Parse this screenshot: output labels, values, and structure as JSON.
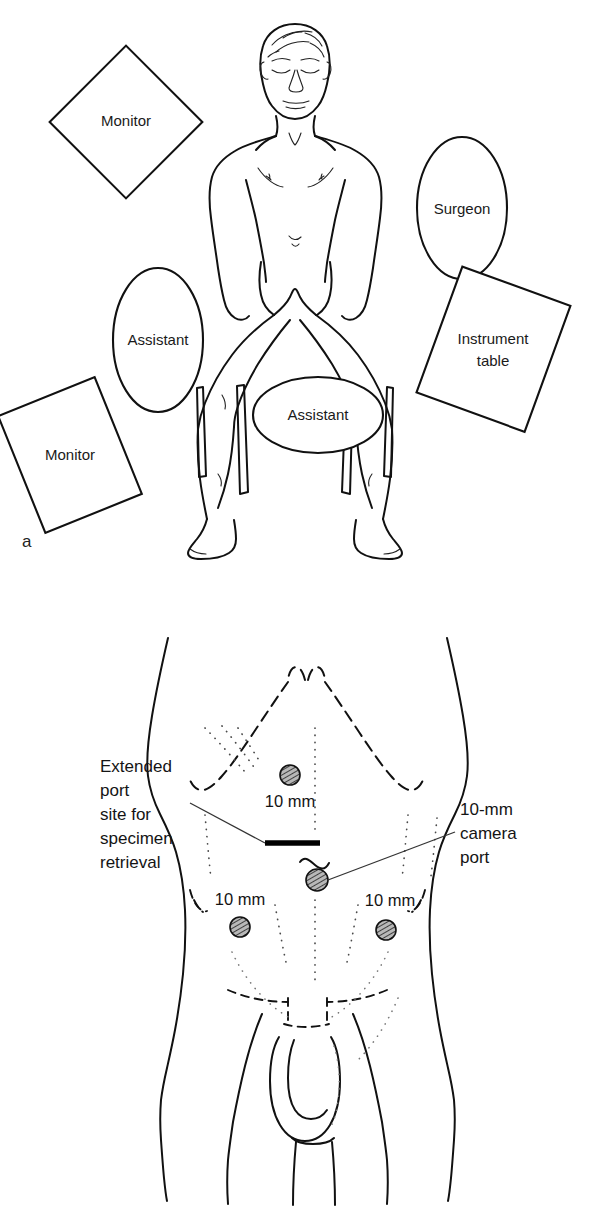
{
  "figure": {
    "panels": [
      {
        "letter": "a",
        "caption_role": "operating-room-setup",
        "roles": [
          {
            "name": "monitor-top-left",
            "label": "Monitor",
            "shape": "square-rotated"
          },
          {
            "name": "monitor-bottom-left",
            "label": "Monitor",
            "shape": "rectangle-rotated"
          },
          {
            "name": "surgeon",
            "label": "Surgeon",
            "shape": "ellipse-vertical"
          },
          {
            "name": "assistant-left",
            "label": "Assistant",
            "shape": "ellipse-vertical"
          },
          {
            "name": "assistant-foot",
            "label": "Assistant",
            "shape": "ellipse-horizontal"
          },
          {
            "name": "instrument-table",
            "label": "Instrument table",
            "shape": "rectangle-rotated",
            "label_lines": [
              "Instrument",
              "table"
            ]
          }
        ]
      },
      {
        "letter": "b",
        "caption_role": "port-placement",
        "annotations": {
          "extended_port": {
            "lines": [
              "Extended",
              "port",
              "site for",
              "specimen",
              "retrieval"
            ],
            "text": "Extended port site for specimen retrieval"
          },
          "camera_port": {
            "lines": [
              "10-mm",
              "camera",
              "port"
            ],
            "text": "10-mm camera port"
          }
        },
        "ports": [
          {
            "name": "port-upper-midline",
            "label": "10 mm",
            "label_position": "below",
            "diameter_mm": 10
          },
          {
            "name": "port-camera-umbilical",
            "label": "10-mm camera port",
            "label_position": "leader-right",
            "diameter_mm": 10
          },
          {
            "name": "port-lower-right-of-image",
            "label": "10 mm",
            "label_position": "above",
            "diameter_mm": 10
          },
          {
            "name": "port-lower-left-of-image",
            "label": "10 mm",
            "label_position": "above",
            "diameter_mm": 10
          }
        ],
        "markers": [
          {
            "name": "extended-port-incision",
            "style": "solid-black-bar"
          },
          {
            "name": "umbilicus",
            "style": "wavy-line"
          }
        ]
      }
    ]
  },
  "colors": {
    "ink": "#111111",
    "paper": "#ffffff",
    "port_fill": "#8c8c8c",
    "leader": "#333333"
  }
}
